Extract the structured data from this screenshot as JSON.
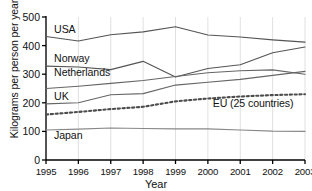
{
  "chart_data": {
    "type": "line",
    "title": "",
    "xlabel": "Year",
    "ylabel": "Kilograms per person per year",
    "x": [
      1995,
      1996,
      1997,
      1998,
      1999,
      2000,
      2001,
      2002,
      2003
    ],
    "xticklabels": [
      "1995",
      "1996",
      "1997",
      "1998",
      "1999",
      "2000",
      "2001",
      "2002",
      "2003"
    ],
    "yticklabels": [
      "0",
      "100",
      "200",
      "300",
      "400",
      "500"
    ],
    "yticks": [
      0,
      100,
      200,
      300,
      400,
      500
    ],
    "xlim": [
      1995,
      2003
    ],
    "ylim": [
      0,
      500
    ],
    "grid": "vertical",
    "legend": "inline-labels",
    "series": [
      {
        "name": "USA",
        "style": "solid",
        "color": "#555555",
        "label_x": 1995.25,
        "label_y": 455,
        "values": [
          432,
          416,
          438,
          448,
          466,
          437,
          430,
          420,
          412
        ]
      },
      {
        "name": "Norway",
        "style": "solid",
        "color": "#555555",
        "label_x": 1995.25,
        "label_y": 352,
        "values": [
          328,
          325,
          316,
          345,
          290,
          320,
          333,
          375,
          395
        ]
      },
      {
        "name": "Netherlands",
        "style": "solid",
        "color": "#666666",
        "label_x": 1995.25,
        "label_y": 303,
        "values": [
          250,
          258,
          268,
          278,
          292,
          305,
          312,
          315,
          300
        ]
      },
      {
        "name": "UK",
        "style": "solid",
        "color": "#666666",
        "label_x": 1995.25,
        "label_y": 222,
        "values": [
          196,
          200,
          228,
          232,
          262,
          272,
          282,
          296,
          310
        ]
      },
      {
        "name": "EU (25 countries)",
        "style": "dotted",
        "color": "#4d4d4d",
        "label_x": 2000.15,
        "label_y": 196,
        "values": [
          159,
          168,
          178,
          186,
          205,
          215,
          222,
          227,
          230
        ]
      },
      {
        "name": "Japan",
        "style": "solid",
        "color": "#888888",
        "label_x": 1995.25,
        "label_y": 83,
        "values": [
          105,
          108,
          112,
          110,
          109,
          109,
          105,
          101,
          100
        ]
      }
    ]
  }
}
